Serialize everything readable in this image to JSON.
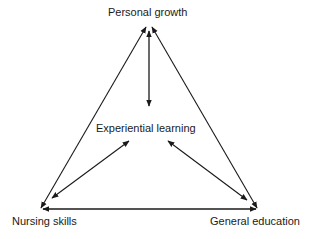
{
  "diagram": {
    "type": "triangle-relationship-diagram",
    "nodes": {
      "top": "Personal growth",
      "center": "Experiential learning",
      "bottom_left": "Nursing skills",
      "bottom_right": "General education"
    },
    "edges": [
      {
        "from": "Personal growth",
        "to": "Nursing skills",
        "arrows": "both"
      },
      {
        "from": "Personal growth",
        "to": "General education",
        "arrows": "both"
      },
      {
        "from": "Nursing skills",
        "to": "General education",
        "arrows": "both"
      },
      {
        "from": "Personal growth",
        "to": "Experiential learning",
        "arrows": "both"
      },
      {
        "from": "Experiential learning",
        "to": "Nursing skills",
        "arrows": "both"
      },
      {
        "from": "Experiential learning",
        "to": "General education",
        "arrows": "both"
      }
    ],
    "colors": {
      "line": "#1a1a1a",
      "background": "#ffffff",
      "text": "#1a1a1a"
    }
  }
}
